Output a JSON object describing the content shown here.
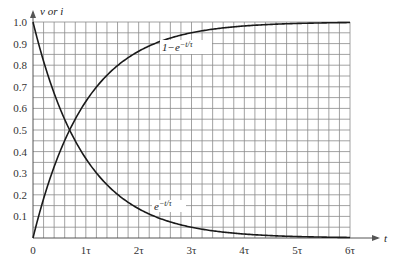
{
  "chart_data": {
    "type": "line",
    "title": "",
    "xlabel": "t",
    "ylabel": "v or i",
    "x_ticks": [
      "0",
      "1τ",
      "2τ",
      "3τ",
      "4τ",
      "5τ",
      "6τ"
    ],
    "y_ticks": [
      "0.1",
      "0.2",
      "0.3",
      "0.4",
      "0.5",
      "0.6",
      "0.7",
      "0.8",
      "0.9",
      "1.0"
    ],
    "xlim": [
      0,
      6
    ],
    "ylim": [
      0,
      1.0
    ],
    "grid": true,
    "grid_minor_x_per_tau": 5,
    "grid_minor_y_per_0_1": 2,
    "x_unit": "τ",
    "series": [
      {
        "name": "1−e^(−t/τ)",
        "label": "1−e",
        "label_sup": "−t/τ",
        "x": [
          0,
          0.5,
          1,
          1.5,
          2,
          2.5,
          3,
          3.5,
          4,
          4.5,
          5,
          5.5,
          6
        ],
        "values": [
          0,
          0.393,
          0.632,
          0.777,
          0.865,
          0.918,
          0.95,
          0.97,
          0.982,
          0.989,
          0.993,
          0.996,
          0.998
        ]
      },
      {
        "name": "e^(−t/τ)",
        "label": "e",
        "label_sup": "−t/τ",
        "x": [
          0,
          0.5,
          1,
          1.5,
          2,
          2.5,
          3,
          3.5,
          4,
          4.5,
          5,
          5.5,
          6
        ],
        "values": [
          1.0,
          0.607,
          0.368,
          0.223,
          0.135,
          0.082,
          0.05,
          0.03,
          0.018,
          0.011,
          0.007,
          0.004,
          0.002
        ]
      }
    ],
    "annotations": [
      {
        "text": "1−e^(−t/τ)",
        "near": "rising curve, around t≈2.5τ, y≈0.9"
      },
      {
        "text": "e^(−t/τ)",
        "near": "decaying curve, around t≈2.5τ, y≈0.12"
      }
    ]
  }
}
